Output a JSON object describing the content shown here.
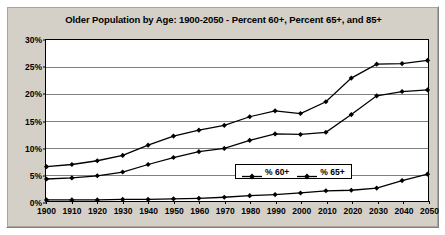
{
  "chart_data": {
    "type": "line",
    "title": "Older Population by Age: 1900-2050 - Percent 60+, Percent 65+, and 85+",
    "xlabel": "",
    "ylabel": "",
    "x": [
      1900,
      1910,
      1920,
      1930,
      1940,
      1950,
      1960,
      1970,
      1980,
      1990,
      2000,
      2010,
      2020,
      2030,
      2040,
      2050
    ],
    "categories": [
      "1900",
      "1910",
      "1920",
      "1930",
      "1940",
      "1950",
      "1960",
      "1970",
      "1980",
      "1990",
      "2000",
      "2010",
      "2020",
      "2030",
      "2040",
      "2050"
    ],
    "series": [
      {
        "name": "% 60+",
        "color": "#000000",
        "marker": "diamond",
        "values": [
          6.4,
          6.8,
          7.5,
          8.5,
          10.4,
          12.1,
          13.2,
          14.1,
          15.7,
          16.8,
          16.3,
          18.5,
          22.9,
          25.5,
          25.6,
          26.2
        ]
      },
      {
        "name": "% 65+",
        "color": "#000000",
        "marker": "diamond",
        "values": [
          4.1,
          4.3,
          4.7,
          5.4,
          6.8,
          8.1,
          9.2,
          9.8,
          11.3,
          12.5,
          12.4,
          12.8,
          16.1,
          19.6,
          20.4,
          20.7
        ]
      },
      {
        "name": "% 85+",
        "color": "#000000",
        "marker": "diamond",
        "values": [
          0.2,
          0.2,
          0.2,
          0.3,
          0.3,
          0.4,
          0.5,
          0.7,
          1.0,
          1.2,
          1.5,
          1.9,
          2.0,
          2.4,
          3.8,
          5.0
        ]
      }
    ],
    "ylim": [
      0,
      30
    ],
    "ytick_values": [
      0,
      5,
      10,
      15,
      20,
      25,
      30
    ],
    "ytick_labels": [
      "0%",
      "5%",
      "10%",
      "15%",
      "20%",
      "25%",
      "30%"
    ],
    "grid": true,
    "grid_axis": "y",
    "legend": {
      "position": "inside-center-lower",
      "entries": [
        "% 60+",
        "% 65+"
      ]
    },
    "colors": {
      "panel_background": "#d4d0c8",
      "plot_background": "#ffffff",
      "axis": "#000000",
      "gridline": "#808080",
      "line": "#000000",
      "text": "#000000"
    }
  }
}
